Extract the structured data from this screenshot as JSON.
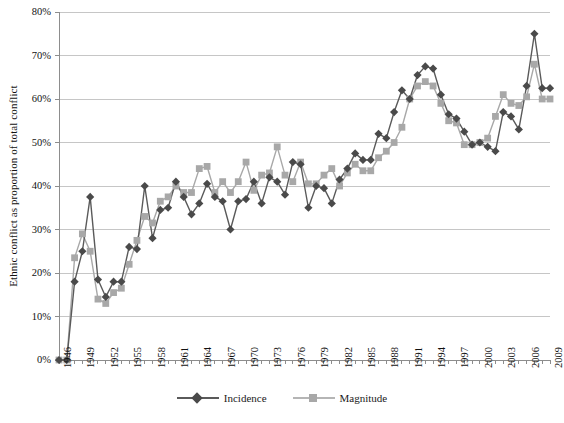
{
  "chart_data": {
    "type": "line",
    "title": "",
    "xlabel": "",
    "ylabel": "Ethnic conflict as proportion of total conflict",
    "ylim": [
      0,
      80
    ],
    "ytick_labels": [
      "0%",
      "10%",
      "20%",
      "30%",
      "40%",
      "50%",
      "60%",
      "70%",
      "80%"
    ],
    "ytick_values": [
      0,
      10,
      20,
      30,
      40,
      50,
      60,
      70,
      80
    ],
    "xlim": [
      1946,
      2009
    ],
    "xtick_labels": [
      "1946",
      "1949",
      "1952",
      "1955",
      "1958",
      "1961",
      "1964",
      "1967",
      "1970",
      "1973",
      "1976",
      "1979",
      "1982",
      "1985",
      "1988",
      "1991",
      "1994",
      "1997",
      "2000",
      "2003",
      "2006",
      "2009"
    ],
    "grid": "horizontal",
    "legend_position": "bottom",
    "x": [
      1946,
      1947,
      1948,
      1949,
      1950,
      1951,
      1952,
      1953,
      1954,
      1955,
      1956,
      1957,
      1958,
      1959,
      1960,
      1961,
      1962,
      1963,
      1964,
      1965,
      1966,
      1967,
      1968,
      1969,
      1970,
      1971,
      1972,
      1973,
      1974,
      1975,
      1976,
      1977,
      1978,
      1979,
      1980,
      1981,
      1982,
      1983,
      1984,
      1985,
      1986,
      1987,
      1988,
      1989,
      1990,
      1991,
      1992,
      1993,
      1994,
      1995,
      1996,
      1997,
      1998,
      1999,
      2000,
      2001,
      2002,
      2003,
      2004,
      2005,
      2006,
      2007,
      2008,
      2009
    ],
    "series": [
      {
        "name": "Incidence",
        "color": "#5a5a5a",
        "marker": "diamond",
        "values": [
          0,
          0,
          18,
          25,
          37.5,
          18.5,
          14.5,
          18,
          18,
          26,
          25.5,
          40,
          28,
          34.5,
          35,
          41,
          37.5,
          33.5,
          36,
          40.5,
          37.5,
          36.5,
          30,
          36.5,
          37,
          41,
          36,
          42,
          41,
          38,
          45.5,
          45,
          35,
          40,
          39.5,
          36,
          41.5,
          44,
          47.5,
          46,
          46,
          52,
          51,
          57,
          62,
          60,
          65.5,
          67.5,
          67,
          61,
          56.5,
          55.5,
          52.5,
          49.5,
          50,
          49,
          48,
          57,
          56,
          53,
          63,
          75,
          62.5,
          62.5
        ]
      },
      {
        "name": "Magnitude",
        "color": "#a8a8a8",
        "marker": "square",
        "values": [
          0,
          0,
          23.5,
          29,
          25,
          14,
          13,
          15.5,
          16.5,
          22,
          27.5,
          33,
          31.5,
          36.5,
          37.5,
          40,
          38.5,
          38.5,
          44,
          44.5,
          38.5,
          41,
          38.5,
          41,
          45.5,
          39,
          42.5,
          43,
          49,
          42.5,
          41,
          45.5,
          40.5,
          40.5,
          42.5,
          44,
          40,
          43,
          45,
          43.5,
          43.5,
          46.5,
          48,
          50,
          53.5,
          60,
          63,
          64,
          63,
          59,
          55,
          54.5,
          49.5,
          49.5,
          50,
          51,
          56,
          61,
          59,
          58.5,
          60.5,
          68,
          60,
          60
        ]
      }
    ]
  },
  "legend": {
    "items": [
      {
        "label": "Incidence"
      },
      {
        "label": "Magnitude"
      }
    ]
  }
}
